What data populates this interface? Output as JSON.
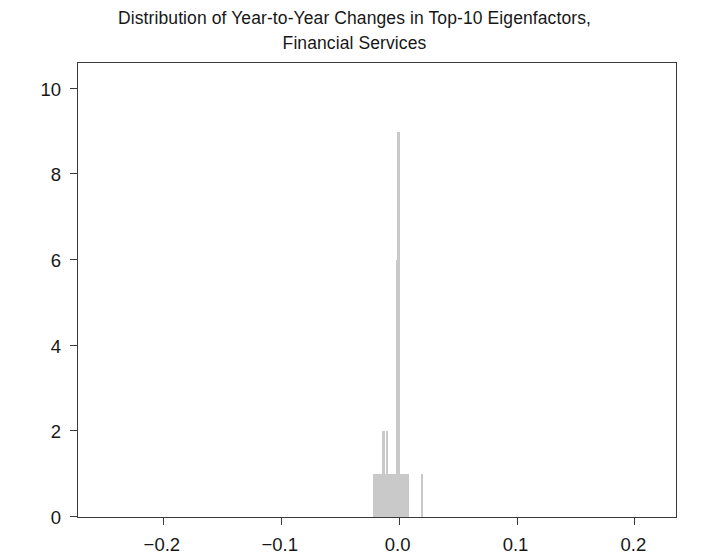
{
  "chart_data": {
    "type": "bar",
    "title": "Distribution of Year-to-Year Changes in Top-10 Eigenfactors, Financial Services",
    "title_line1": "Distribution of Year-to-Year Changes in Top-10 Eigenfactors,",
    "title_line2": "Financial Services",
    "xlabel": "",
    "ylabel": "",
    "xlim": [
      -0.272,
      0.237
    ],
    "ylim": [
      0,
      10.65
    ],
    "xticks": [
      -0.2,
      -0.1,
      0.0,
      0.1,
      0.2
    ],
    "xtick_labels": [
      "−0.2",
      "−0.1",
      "0.0",
      "0.1",
      "0.2"
    ],
    "yticks": [
      0,
      2,
      4,
      6,
      8,
      10
    ],
    "ytick_labels": [
      "0",
      "2",
      "4",
      "6",
      "8",
      "10"
    ],
    "grid": false,
    "legend": null,
    "bar_color": "#c9c9c9",
    "bin_width": 0.0014,
    "bins": [
      {
        "x": -0.0205,
        "count": 1
      },
      {
        "x": -0.019,
        "count": 1
      },
      {
        "x": -0.0176,
        "count": 1
      },
      {
        "x": -0.016,
        "count": 1
      },
      {
        "x": -0.0144,
        "count": 1
      },
      {
        "x": -0.0128,
        "count": 2
      },
      {
        "x": -0.0114,
        "count": 1
      },
      {
        "x": -0.01,
        "count": 2
      },
      {
        "x": -0.0086,
        "count": 1
      },
      {
        "x": -0.0072,
        "count": 1
      },
      {
        "x": -0.0058,
        "count": 1
      },
      {
        "x": -0.0044,
        "count": 1
      },
      {
        "x": -0.003,
        "count": 1
      },
      {
        "x": -0.0016,
        "count": 6
      },
      {
        "x": 0.0,
        "count": 9
      },
      {
        "x": 0.0014,
        "count": 1
      },
      {
        "x": 0.0028,
        "count": 1
      },
      {
        "x": 0.0044,
        "count": 1
      },
      {
        "x": 0.006,
        "count": 1
      },
      {
        "x": 0.0076,
        "count": 1
      },
      {
        "x": 0.02,
        "count": 1
      }
    ]
  }
}
